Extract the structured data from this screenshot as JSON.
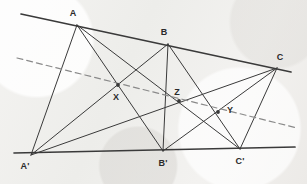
{
  "figure": {
    "background_color": "#f1f0ee",
    "line_color": "#3a3a3a",
    "dashed_line_color": "#8a8a8a",
    "label_color": "#2a2a2a",
    "width": 307,
    "height": 184
  },
  "labels": {
    "A": "A",
    "B": "B",
    "C": "C",
    "Ap": "A'",
    "Bp": "B'",
    "Cp": "C'",
    "X": "X",
    "Y": "Y",
    "Z": "Z"
  },
  "points": {
    "A": {
      "x": 77,
      "y": 25,
      "label_x": 73,
      "label_y": 13
    },
    "B": {
      "x": 168,
      "y": 44,
      "label_x": 164,
      "label_y": 32
    },
    "C": {
      "x": 277,
      "y": 68,
      "label_x": 280,
      "label_y": 57
    },
    "Ap": {
      "x": 31,
      "y": 155,
      "label_x": 25,
      "label_y": 166
    },
    "Bp": {
      "x": 163,
      "y": 151,
      "label_x": 163,
      "label_y": 163
    },
    "Cp": {
      "x": 240,
      "y": 149,
      "label_x": 240,
      "label_y": 161
    },
    "X": {
      "x": 118,
      "y": 85,
      "label_x": 116,
      "label_y": 97
    },
    "Z": {
      "x": 179,
      "y": 101,
      "label_x": 177,
      "label_y": 92
    },
    "Y": {
      "x": 218,
      "y": 112,
      "label_x": 230,
      "label_y": 110
    }
  },
  "lines": {
    "top_line": {
      "x1": 21,
      "y1": 14,
      "x2": 291,
      "y2": 72,
      "style": "solid",
      "width": 1.7
    },
    "bottom_line": {
      "x1": 14,
      "y1": 153,
      "x2": 295,
      "y2": 147,
      "style": "solid",
      "width": 1.7
    },
    "pappus_line": {
      "x1": 17,
      "y1": 58,
      "x2": 297,
      "y2": 128,
      "style": "dashed",
      "width": 1.2
    }
  },
  "connectors": [
    {
      "name": "A-Ap",
      "from": "A",
      "to": "Ap"
    },
    {
      "name": "A-Bp",
      "from": "A",
      "to": "Bp"
    },
    {
      "name": "A-Cp",
      "from": "A",
      "to": "Cp"
    },
    {
      "name": "B-Ap",
      "from": "B",
      "to": "Ap"
    },
    {
      "name": "B-Bp",
      "from": "B",
      "to": "Bp"
    },
    {
      "name": "B-Cp",
      "from": "B",
      "to": "Cp"
    },
    {
      "name": "C-Ap",
      "from": "C",
      "to": "Ap"
    },
    {
      "name": "C-Bp",
      "from": "C",
      "to": "Bp"
    },
    {
      "name": "C-Cp",
      "from": "C",
      "to": "Cp"
    }
  ],
  "intersection_points": [
    "X",
    "Z",
    "Y"
  ]
}
